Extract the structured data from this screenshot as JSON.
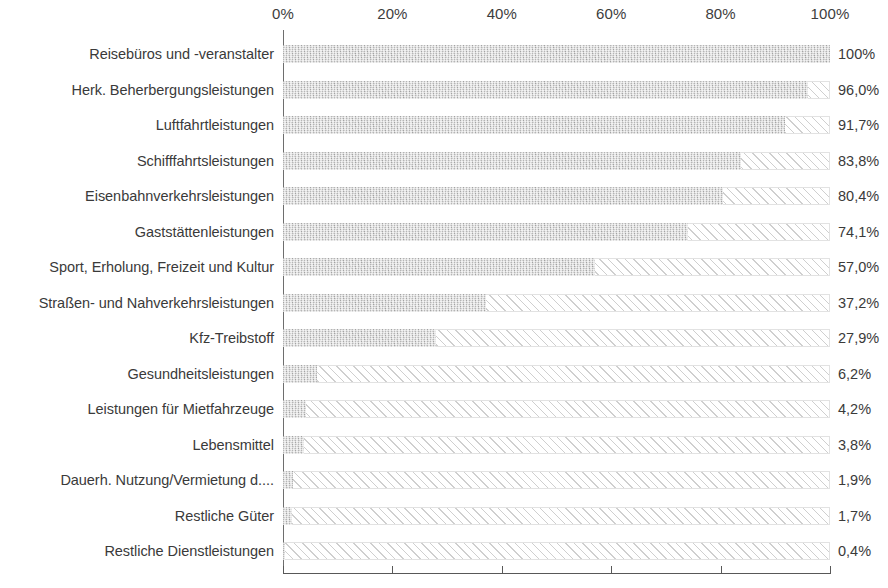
{
  "chart_data": {
    "type": "bar",
    "orientation": "horizontal",
    "title": "",
    "subtitle": "",
    "xlabel": "",
    "ylabel": "",
    "xlim": [
      0,
      100
    ],
    "grid": false,
    "legend": null,
    "axis_ticks": [
      "0%",
      "20%",
      "40%",
      "60%",
      "80%",
      "100%"
    ],
    "axis_tick_values": [
      0,
      20,
      40,
      60,
      80,
      100
    ],
    "value_suffix": "%",
    "decimal_separator": ",",
    "series_name": "Anteil",
    "fill_style": "speckled-grey",
    "remainder_style": "diagonal-hatch",
    "categories": [
      "Reisebüros und -veranstalter",
      "Herk. Beherbergungsleistungen",
      "Luftfahrtleistungen",
      "Schifffahrtsleistungen",
      "Eisenbahnverkehrsleistungen",
      "Gaststättenleistungen",
      "Sport, Erholung, Freizeit und Kultur",
      "Straßen- und Nahverkehrsleistungen",
      "Kfz-Treibstoff",
      "Gesundheitsleistungen",
      "Leistungen für Mietfahrzeuge",
      "Lebensmittel",
      "Dauerh. Nutzung/Vermietung d....",
      "Restliche Güter",
      "Restliche Dienstleistungen"
    ],
    "values": [
      100,
      96.0,
      91.7,
      83.8,
      80.4,
      74.1,
      57.0,
      37.2,
      27.9,
      6.2,
      4.2,
      3.8,
      1.9,
      1.7,
      0.4
    ],
    "value_labels": [
      "100%",
      "96,0%",
      "91,7%",
      "83,8%",
      "80,4%",
      "74,1%",
      "57,0%",
      "37,2%",
      "27,9%",
      "6,2%",
      "4,2%",
      "3,8%",
      "1,9%",
      "1,7%",
      "0,4%"
    ]
  },
  "colors": {
    "bar_fill": "#c9c9c9",
    "hatch_line": "#cfcfcf",
    "track_border": "#e2e2e2",
    "axis_line": "#585858",
    "text": "#3a3a3a",
    "background": "#ffffff"
  }
}
